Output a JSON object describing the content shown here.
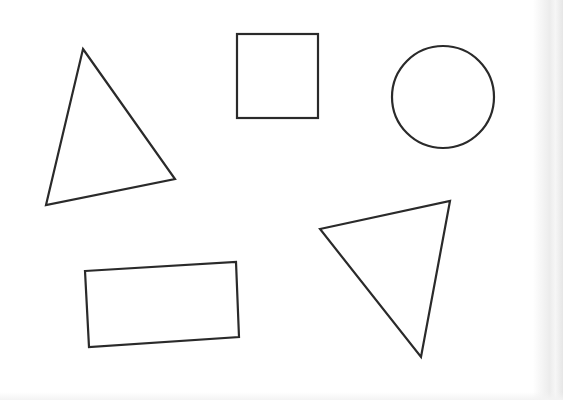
{
  "page": {
    "background": "#ffffff",
    "stroke_color": "#2a2a2a",
    "stroke_width": 2.2
  },
  "shapes": [
    {
      "id": "triangle-upper-left",
      "type": "triangle",
      "points": "83,49 175,179 46,205"
    },
    {
      "id": "square",
      "type": "square",
      "x": 237,
      "y": 34,
      "width": 81,
      "height": 84
    },
    {
      "id": "circle",
      "type": "circle",
      "cx": 443,
      "cy": 97,
      "r": 51
    },
    {
      "id": "triangle-lower-right",
      "type": "triangle",
      "points": "320,229 450,201 421,357"
    },
    {
      "id": "rectangle-tilted",
      "type": "rectangle",
      "points": "85,271 236,262 239,337 89,347"
    }
  ]
}
